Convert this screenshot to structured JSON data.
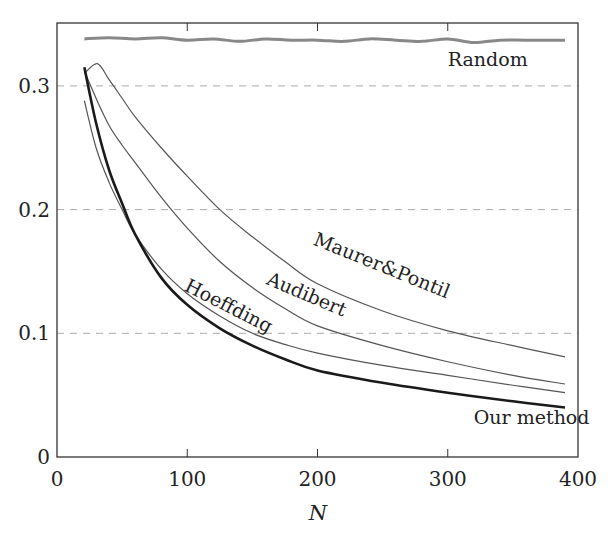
{
  "chart_data": {
    "type": "line",
    "title": "",
    "xlabel": "N",
    "ylabel": "",
    "xlim": [
      0,
      400
    ],
    "ylim": [
      0,
      0.34
    ],
    "x_ticks": [
      0,
      100,
      200,
      300,
      400
    ],
    "x_tick_labels": [
      "0",
      "100",
      "200",
      "300",
      "400"
    ],
    "y_ticks": [
      0,
      0.1,
      0.2,
      0.3
    ],
    "y_tick_labels": [
      "0",
      "0.1",
      "0.2",
      "0.3"
    ],
    "grid": "horizontal dashed at 0.1, 0.2, 0.3",
    "legend": "inline curve labels",
    "series": [
      {
        "name": "Random",
        "color": "#888888",
        "width": 3,
        "x": [
          21,
          40,
          60,
          80,
          100,
          120,
          140,
          160,
          180,
          200,
          220,
          240,
          260,
          280,
          300,
          320,
          340,
          360,
          390
        ],
        "values": [
          0.338,
          0.339,
          0.338,
          0.339,
          0.337,
          0.338,
          0.336,
          0.338,
          0.337,
          0.337,
          0.336,
          0.338,
          0.337,
          0.336,
          0.338,
          0.335,
          0.337,
          0.337,
          0.337
        ]
      },
      {
        "name": "Maurer&Pontil",
        "color": "#555555",
        "width": 1.2,
        "x": [
          21,
          31,
          40,
          50,
          60,
          80,
          100,
          125,
          150,
          175,
          200,
          250,
          300,
          350,
          390
        ],
        "values": [
          0.31,
          0.318,
          0.305,
          0.29,
          0.275,
          0.25,
          0.227,
          0.2,
          0.178,
          0.158,
          0.14,
          0.118,
          0.102,
          0.09,
          0.081
        ]
      },
      {
        "name": "Audibert",
        "color": "#555555",
        "width": 1.2,
        "x": [
          21,
          30,
          40,
          50,
          60,
          80,
          100,
          125,
          150,
          175,
          200,
          250,
          300,
          350,
          390
        ],
        "values": [
          0.312,
          0.29,
          0.268,
          0.252,
          0.238,
          0.21,
          0.185,
          0.158,
          0.137,
          0.12,
          0.106,
          0.09,
          0.077,
          0.066,
          0.059
        ]
      },
      {
        "name": "Hoeffding",
        "color": "#555555",
        "width": 1.2,
        "x": [
          21,
          30,
          40,
          50,
          60,
          80,
          100,
          125,
          150,
          175,
          200,
          250,
          300,
          350,
          390
        ],
        "values": [
          0.288,
          0.25,
          0.222,
          0.2,
          0.18,
          0.152,
          0.132,
          0.114,
          0.1,
          0.091,
          0.084,
          0.074,
          0.066,
          0.058,
          0.052
        ]
      },
      {
        "name": "Our method",
        "color": "#1a1a1a",
        "width": 2.6,
        "x": [
          21,
          30,
          40,
          50,
          60,
          80,
          100,
          125,
          150,
          175,
          200,
          250,
          300,
          350,
          390
        ],
        "values": [
          0.315,
          0.27,
          0.232,
          0.205,
          0.18,
          0.145,
          0.123,
          0.104,
          0.09,
          0.079,
          0.07,
          0.06,
          0.052,
          0.045,
          0.04
        ]
      }
    ],
    "annotations": [
      {
        "text": "Random",
        "x": 300,
        "y": 0.316,
        "rotation": 0
      },
      {
        "text": "Maurer&Pontil",
        "x": 196,
        "y": 0.172,
        "rotation": 22
      },
      {
        "text": "Audibert",
        "x": 160,
        "y": 0.14,
        "rotation": 23
      },
      {
        "text": "Hoeffding",
        "x": 97,
        "y": 0.135,
        "rotation": 27
      },
      {
        "text": "Our method",
        "x": 320,
        "y": 0.027,
        "rotation": 0
      }
    ]
  }
}
